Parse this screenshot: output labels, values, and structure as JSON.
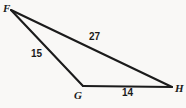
{
  "figure": {
    "type": "triangle-diagram",
    "background_color": "#f9f8f6",
    "stroke_color": "#1b1b1b",
    "vertices": [
      {
        "name": "F",
        "label": "F",
        "x": 11,
        "y": 10
      },
      {
        "name": "G",
        "label": "G",
        "x": 83,
        "y": 86
      },
      {
        "name": "H",
        "label": "H",
        "x": 172,
        "y": 87
      }
    ],
    "sides": [
      {
        "name": "FH",
        "label": "27",
        "from": "F",
        "to": "H"
      },
      {
        "name": "FG",
        "label": "15",
        "from": "F",
        "to": "G"
      },
      {
        "name": "GH",
        "label": "14",
        "from": "G",
        "to": "H"
      }
    ]
  }
}
